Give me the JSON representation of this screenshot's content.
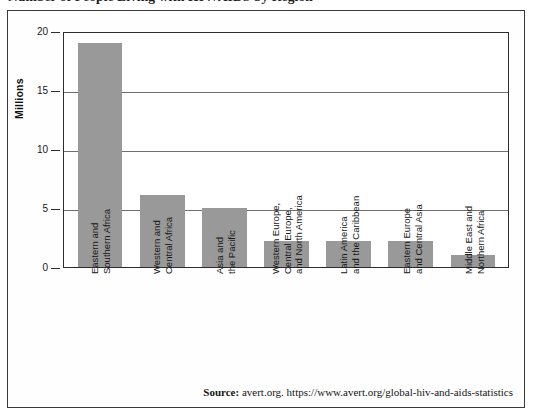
{
  "figure": {
    "title": "Number of People Living with HIV/AIDS by Region",
    "source_label": "Source:",
    "source_text": "avert.org. https://www.avert.org/global-hiv-and-aids-statistics"
  },
  "colors": {
    "bar_fill": "#999999",
    "frame": "#2e2e2e",
    "gridline": "#6e6e6e",
    "text": "#161616"
  },
  "chart_data": {
    "type": "bar",
    "title": "Number of People Living with HIV/AIDS by Region",
    "xlabel": "",
    "ylabel": "Millions",
    "ylim": [
      0,
      20
    ],
    "yticks": [
      0,
      5,
      10,
      15,
      20
    ],
    "ytick_labels": [
      "0",
      "5",
      "10",
      "15",
      "20"
    ],
    "grid": true,
    "legend": false,
    "categories": [
      "Eastern and Southern Africa",
      "Western and Central Africa",
      "Asia and the Pacific",
      "Western Europe, Central Europe, and North America",
      "Latin America and the Caribbean",
      "Eastern Europe and Central Asia",
      "Middle East and Northern Africa"
    ],
    "category_lines": [
      [
        "Eastern and",
        "Southern Africa"
      ],
      [
        "Western and",
        "Central Africa"
      ],
      [
        "Asia and",
        "the Pacific"
      ],
      [
        "Western Europe,",
        "Central Europe,",
        "and North America"
      ],
      [
        "Latin America",
        "and the Caribbean"
      ],
      [
        "Eastern Europe",
        "and Central Asia"
      ],
      [
        "Middle East and",
        "Northern Africa"
      ]
    ],
    "values": [
      19.0,
      6.1,
      5.0,
      2.2,
      2.2,
      2.2,
      1.0
    ],
    "units": "Millions"
  }
}
